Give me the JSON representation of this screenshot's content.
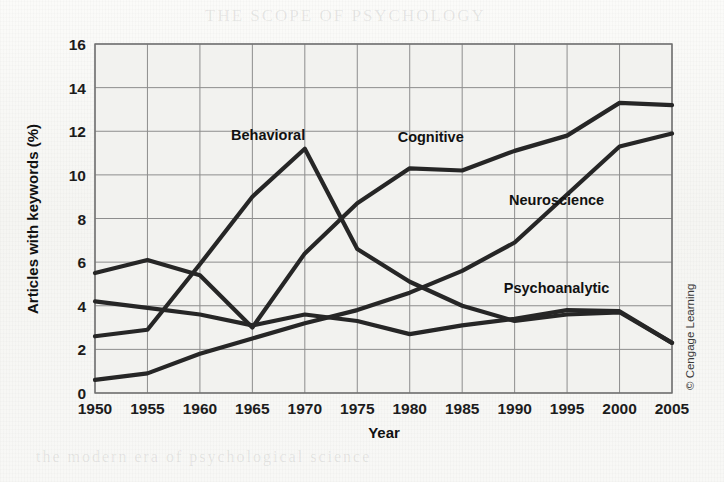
{
  "figure": {
    "credit": "© Cengage Learning",
    "background_color": "#f7f7f5",
    "line_color": "#262626",
    "grid_color": "#8d8d8d"
  },
  "chart_data": {
    "type": "line",
    "title": "",
    "xlabel": "Year",
    "ylabel": "Articles with keywords (%)",
    "x": [
      1950,
      1955,
      1960,
      1965,
      1970,
      1975,
      1980,
      1985,
      1990,
      1995,
      2000,
      2005
    ],
    "xticklabels": [
      "1950",
      "1955",
      "1960",
      "1965",
      "1970",
      "1975",
      "1980",
      "1985",
      "1990",
      "1995",
      "2000",
      "2005"
    ],
    "yticks": [
      0,
      2,
      4,
      6,
      8,
      10,
      12,
      14,
      16
    ],
    "yticklabels": [
      "0",
      "2",
      "4",
      "6",
      "8",
      "10",
      "12",
      "14",
      "16"
    ],
    "xlim": [
      1950,
      2005
    ],
    "ylim": [
      0,
      16
    ],
    "grid": true,
    "legend_position": "inline-labels",
    "series": [
      {
        "name": "Behavioral",
        "label_x": 1966.5,
        "label_y": 11.6,
        "values": [
          2.6,
          2.9,
          5.9,
          9.0,
          11.2,
          6.6,
          5.1,
          4.0,
          3.3,
          3.6,
          3.7,
          2.3
        ]
      },
      {
        "name": "Cognitive",
        "label_x": 1982.0,
        "label_y": 11.5,
        "values": [
          5.5,
          6.1,
          5.4,
          3.0,
          6.4,
          8.7,
          10.3,
          10.2,
          11.1,
          11.8,
          13.3,
          13.2
        ]
      },
      {
        "name": "Neuroscience",
        "label_x": 1994.0,
        "label_y": 8.6,
        "values": [
          0.6,
          0.9,
          1.8,
          2.5,
          3.2,
          3.8,
          4.6,
          5.6,
          6.9,
          9.1,
          11.3,
          11.9
        ]
      },
      {
        "name": "Psychoanalytic",
        "label_x": 1994.0,
        "label_y": 4.6,
        "values": [
          4.2,
          3.9,
          3.6,
          3.1,
          3.6,
          3.3,
          2.7,
          3.1,
          3.4,
          3.8,
          3.75,
          2.3
        ]
      }
    ]
  }
}
